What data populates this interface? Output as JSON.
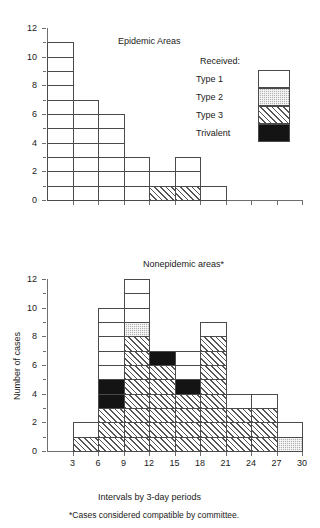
{
  "figure": {
    "footnote": "*Cases considered compatible by committee."
  },
  "legend": {
    "title": "Received:",
    "items": [
      {
        "label": "Type 1",
        "key": "t1",
        "color": "#ffffff"
      },
      {
        "label": "Type 2",
        "key": "t2",
        "color": "#b4b4b4"
      },
      {
        "label": "Type 3",
        "key": "t3",
        "color": "#808080"
      },
      {
        "label": "Trivalent",
        "key": "tv",
        "color": "#141414"
      }
    ]
  },
  "chart_data": [
    {
      "id": "epidemic",
      "type": "bar",
      "title": "Epidemic Areas",
      "xlabel": "",
      "ylabel": "",
      "ylim": [
        0,
        12
      ],
      "yticks": [
        0,
        2,
        4,
        6,
        8,
        10,
        12
      ],
      "yticks_minor": [
        1,
        3,
        5,
        7,
        9,
        11
      ],
      "xlim": [
        0,
        30
      ],
      "xticks": [
        3,
        6,
        9,
        12,
        15,
        18,
        21,
        24,
        27,
        30
      ],
      "grid": false,
      "categories": [
        "3",
        "6",
        "9",
        "12",
        "15",
        "18",
        "21",
        "24",
        "27",
        "30"
      ],
      "bin_edges": [
        0,
        3,
        6,
        9,
        12,
        15,
        18,
        21,
        24,
        27,
        30
      ],
      "values": [
        11,
        7,
        6,
        3,
        2,
        3,
        1,
        0,
        0,
        0
      ],
      "series": [
        {
          "name": "Type 3",
          "key": "t3",
          "values": [
            0,
            0,
            0,
            0,
            1,
            1,
            0,
            0,
            0,
            0
          ]
        },
        {
          "name": "Trivalent",
          "key": "tv",
          "values": [
            0,
            0,
            0,
            0,
            0,
            0,
            0,
            0,
            0,
            0
          ]
        },
        {
          "name": "Type 2",
          "key": "t2",
          "values": [
            0,
            0,
            0,
            0,
            0,
            0,
            0,
            0,
            0,
            0
          ]
        },
        {
          "name": "Type 1",
          "key": "t1",
          "values": [
            11,
            7,
            6,
            3,
            1,
            2,
            1,
            0,
            0,
            0
          ]
        }
      ],
      "stacks": [
        [
          {
            "key": "t1",
            "n": 11
          }
        ],
        [
          {
            "key": "t1",
            "n": 7
          }
        ],
        [
          {
            "key": "t1",
            "n": 6
          }
        ],
        [
          {
            "key": "t1",
            "n": 3
          }
        ],
        [
          {
            "key": "t3",
            "n": 1
          },
          {
            "key": "t1",
            "n": 1
          }
        ],
        [
          {
            "key": "t3",
            "n": 1
          },
          {
            "key": "t1",
            "n": 2
          }
        ],
        [
          {
            "key": "t1",
            "n": 1
          }
        ],
        [],
        [],
        []
      ]
    },
    {
      "id": "nonepidemic",
      "type": "bar",
      "title": "Nonepidemic areas*",
      "xlabel": "Intervals by 3-day periods",
      "ylabel": "Number of cases",
      "ylim": [
        0,
        12
      ],
      "yticks": [
        0,
        2,
        4,
        6,
        8,
        10,
        12
      ],
      "yticks_minor": [
        1,
        3,
        5,
        7,
        9,
        11
      ],
      "xlim": [
        0,
        30
      ],
      "xticks": [
        3,
        6,
        9,
        12,
        15,
        18,
        21,
        24,
        27,
        30
      ],
      "grid": false,
      "categories": [
        "3",
        "6",
        "9",
        "12",
        "15",
        "18",
        "21",
        "24",
        "27",
        "30"
      ],
      "bin_edges": [
        0,
        3,
        6,
        9,
        12,
        15,
        18,
        21,
        24,
        27,
        30
      ],
      "values": [
        0,
        2,
        10,
        12,
        7,
        7,
        9,
        4,
        4,
        2
      ],
      "series": [
        {
          "name": "Type 3",
          "key": "t3",
          "values": [
            0,
            1,
            3,
            8,
            6,
            4,
            8,
            3,
            3,
            0
          ]
        },
        {
          "name": "Trivalent",
          "key": "tv",
          "values": [
            0,
            0,
            2,
            0,
            1,
            1,
            0,
            0,
            0,
            0
          ]
        },
        {
          "name": "Type 2",
          "key": "t2",
          "values": [
            0,
            0,
            0,
            1,
            0,
            0,
            0,
            0,
            0,
            1
          ]
        },
        {
          "name": "Type 1",
          "key": "t1",
          "values": [
            0,
            1,
            5,
            3,
            0,
            2,
            1,
            1,
            1,
            1
          ]
        }
      ],
      "stacks": [
        [],
        [
          {
            "key": "t3",
            "n": 1
          },
          {
            "key": "t1",
            "n": 1
          }
        ],
        [
          {
            "key": "t3",
            "n": 3
          },
          {
            "key": "tv",
            "n": 2
          },
          {
            "key": "t1",
            "n": 5
          }
        ],
        [
          {
            "key": "t3",
            "n": 8
          },
          {
            "key": "t2",
            "n": 1
          },
          {
            "key": "t1",
            "n": 3
          }
        ],
        [
          {
            "key": "t3",
            "n": 6
          },
          {
            "key": "tv",
            "n": 1
          }
        ],
        [
          {
            "key": "t3",
            "n": 4
          },
          {
            "key": "tv",
            "n": 1
          },
          {
            "key": "t1",
            "n": 2
          }
        ],
        [
          {
            "key": "t3",
            "n": 8
          },
          {
            "key": "t1",
            "n": 1
          }
        ],
        [
          {
            "key": "t3",
            "n": 3
          },
          {
            "key": "t1",
            "n": 1
          }
        ],
        [
          {
            "key": "t3",
            "n": 3
          },
          {
            "key": "t1",
            "n": 1
          }
        ],
        [
          {
            "key": "t2",
            "n": 1
          },
          {
            "key": "t1",
            "n": 1
          }
        ]
      ]
    }
  ]
}
